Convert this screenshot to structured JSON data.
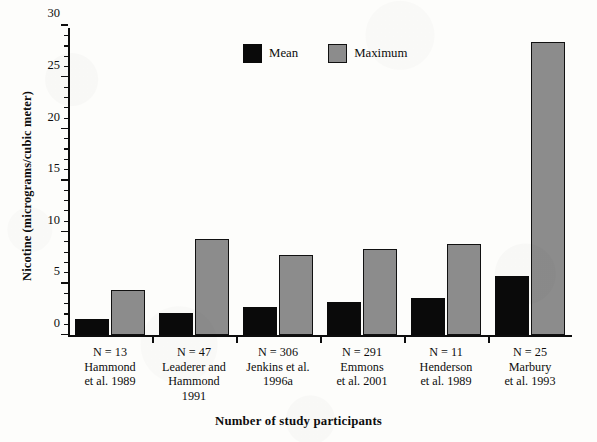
{
  "chart_data": {
    "type": "bar",
    "title": "",
    "xlabel": "Number of study participants",
    "ylabel": "Nicotine (micrograms/cubic meter)",
    "ylim": [
      0,
      30
    ],
    "ytick_step": 5,
    "yminor_step": 1,
    "grid": false,
    "legend_position": "top-center",
    "categories": [
      "Hammond et al. 1989",
      "Leaderer and Hammond 1991",
      "Jenkins et al. 1996a",
      "Emmons et al. 2001",
      "Henderson et al. 1989",
      "Marbury et al. 1993"
    ],
    "participant_counts": [
      "N = 13",
      "N = 47",
      "N = 306",
      "N = 291",
      "N = 11",
      "N = 25"
    ],
    "series": [
      {
        "name": "Mean",
        "color": "#0a0a0a",
        "values": [
          1.6,
          2.2,
          2.7,
          3.2,
          3.6,
          5.7
        ]
      },
      {
        "name": "Maximum",
        "color": "#8c8c8c",
        "values": [
          4.4,
          9.3,
          7.8,
          8.4,
          8.8,
          28.4
        ]
      }
    ],
    "ytick_labels": [
      "0",
      "5",
      "10",
      "15",
      "20",
      "25",
      "30"
    ],
    "ytick_values": [
      0,
      5,
      10,
      15,
      20,
      25,
      30
    ]
  },
  "groups": [
    {
      "n_label": "N = 13",
      "study_lines": [
        "Hammond",
        "et al. 1989"
      ]
    },
    {
      "n_label": "N = 47",
      "study_lines": [
        "Leaderer and",
        "Hammond",
        "1991"
      ]
    },
    {
      "n_label": "N = 306",
      "study_lines": [
        "Jenkins et al.",
        "1996a"
      ]
    },
    {
      "n_label": "N = 291",
      "study_lines": [
        "Emmons",
        "et al. 2001"
      ]
    },
    {
      "n_label": "N = 11",
      "study_lines": [
        "Henderson",
        "et al. 1989"
      ]
    },
    {
      "n_label": "N = 25",
      "study_lines": [
        "Marbury",
        "et al. 1993"
      ]
    }
  ],
  "legend": {
    "mean_label": "Mean",
    "maximum_label": "Maximum"
  },
  "axes": {
    "y_title": "Nicotine (micrograms/cubic meter)",
    "x_title": "Number of study participants"
  },
  "colors": {
    "mean": "#0a0a0a",
    "maximum_fill": "#8c8c8c",
    "maximum_stroke": "#111111",
    "axis": "#0d0d0d",
    "background": "#fdfdfb"
  }
}
